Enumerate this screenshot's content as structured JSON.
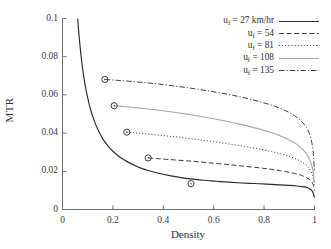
{
  "chart_data": {
    "type": "line",
    "title": "",
    "xlabel": "Density",
    "ylabel": "MTR",
    "xlim": [
      0,
      1
    ],
    "ylim": [
      0,
      0.1
    ],
    "xticks": [
      "0",
      "0.2",
      "0.4",
      "0.6",
      "0.8",
      "1"
    ],
    "xtick_values": [
      0,
      0.2,
      0.4,
      0.6,
      0.8,
      1
    ],
    "yticks": [
      "0",
      "0.02",
      "0.04",
      "0.06",
      "0.08",
      "0.1"
    ],
    "ytick_values": [
      0,
      0.02,
      0.04,
      0.06,
      0.08,
      0.1
    ],
    "grid": false,
    "legend_position": "top-right",
    "series": [
      {
        "name": "u_f = 27 km/hr",
        "label_main": "u",
        "label_sub": "f",
        "label_rest": " = 27 km/hr",
        "style": "solid",
        "color": "#2b2b2b",
        "marker_point": [
          0.51,
          0.0135
        ],
        "x": [
          0.06,
          0.065,
          0.07,
          0.075,
          0.08,
          0.09,
          0.1,
          0.11,
          0.125,
          0.14,
          0.16,
          0.18,
          0.2,
          0.23,
          0.26,
          0.3,
          0.34,
          0.38,
          0.43,
          0.47,
          0.51,
          0.56,
          0.61,
          0.66,
          0.71,
          0.76,
          0.81,
          0.86,
          0.9,
          0.93,
          0.95,
          0.965,
          0.975,
          0.985,
          0.99,
          0.995,
          1.0
        ],
        "y": [
          0.1,
          0.092,
          0.085,
          0.079,
          0.0735,
          0.065,
          0.0585,
          0.053,
          0.0468,
          0.042,
          0.037,
          0.0333,
          0.0305,
          0.0272,
          0.0248,
          0.0223,
          0.0204,
          0.019,
          0.0176,
          0.0167,
          0.016,
          0.0153,
          0.0148,
          0.0143,
          0.0139,
          0.0136,
          0.0133,
          0.0129,
          0.0126,
          0.0123,
          0.012,
          0.0117,
          0.0113,
          0.0105,
          0.0098,
          0.0085,
          0.0062
        ]
      },
      {
        "name": "u_f = 54",
        "label_main": "u",
        "label_sub": "f",
        "label_rest": " = 54",
        "style": "dashed",
        "color": "#3a3a3a",
        "marker_point": [
          0.34,
          0.027
        ],
        "x": [
          0.34,
          0.38,
          0.42,
          0.47,
          0.52,
          0.57,
          0.62,
          0.67,
          0.71,
          0.755,
          0.795,
          0.83,
          0.865,
          0.895,
          0.92,
          0.94,
          0.955,
          0.968,
          0.978,
          0.986,
          0.992,
          0.996,
          1.0
        ],
        "y": [
          0.027,
          0.0266,
          0.0262,
          0.0257,
          0.0252,
          0.0246,
          0.024,
          0.0234,
          0.0228,
          0.0222,
          0.0216,
          0.021,
          0.0203,
          0.0196,
          0.0189,
          0.0182,
          0.0175,
          0.0167,
          0.0159,
          0.0149,
          0.0138,
          0.0124,
          0.01
        ]
      },
      {
        "name": "u_f = 81",
        "label_main": "u",
        "label_sub": "f",
        "label_rest": " = 81",
        "style": "dotted",
        "color": "#4a4a4a",
        "marker_point": [
          0.255,
          0.0405
        ],
        "x": [
          0.255,
          0.3,
          0.35,
          0.4,
          0.45,
          0.5,
          0.55,
          0.6,
          0.65,
          0.7,
          0.745,
          0.79,
          0.83,
          0.865,
          0.895,
          0.92,
          0.94,
          0.955,
          0.968,
          0.978,
          0.986,
          0.992,
          0.996,
          1.0
        ],
        "y": [
          0.0405,
          0.04,
          0.0394,
          0.0387,
          0.038,
          0.0372,
          0.0364,
          0.0355,
          0.0345,
          0.0335,
          0.0325,
          0.0314,
          0.0303,
          0.0292,
          0.028,
          0.0268,
          0.0256,
          0.0244,
          0.0231,
          0.0216,
          0.0199,
          0.018,
          0.0158,
          0.012
        ]
      },
      {
        "name": "u_f = 108",
        "label_main": "u",
        "label_sub": "f",
        "label_rest": " = 108",
        "style": "solid-light",
        "color": "#a8a8a8",
        "marker_point": [
          0.205,
          0.0543
        ],
        "x": [
          0.205,
          0.25,
          0.3,
          0.35,
          0.4,
          0.45,
          0.5,
          0.55,
          0.6,
          0.65,
          0.7,
          0.745,
          0.79,
          0.83,
          0.865,
          0.895,
          0.92,
          0.94,
          0.955,
          0.968,
          0.978,
          0.986,
          0.992,
          0.996,
          1.0
        ],
        "y": [
          0.0543,
          0.0538,
          0.0532,
          0.0525,
          0.0517,
          0.0508,
          0.0498,
          0.0487,
          0.0475,
          0.0462,
          0.0448,
          0.0434,
          0.0418,
          0.0402,
          0.0385,
          0.0367,
          0.0349,
          0.033,
          0.0312,
          0.0292,
          0.027,
          0.0245,
          0.0215,
          0.0182,
          0.014
        ]
      },
      {
        "name": "u_f = 135",
        "label_main": "u",
        "label_sub": "f",
        "label_rest": " = 135",
        "style": "dashdot",
        "color": "#3f3f3f",
        "marker_point": [
          0.168,
          0.0681
        ],
        "x": [
          0.168,
          0.21,
          0.26,
          0.31,
          0.36,
          0.41,
          0.46,
          0.51,
          0.56,
          0.61,
          0.66,
          0.705,
          0.75,
          0.79,
          0.83,
          0.865,
          0.895,
          0.92,
          0.94,
          0.955,
          0.968,
          0.978,
          0.986,
          0.992,
          0.996,
          1.0
        ],
        "y": [
          0.0681,
          0.0677,
          0.0672,
          0.0666,
          0.066,
          0.0652,
          0.0644,
          0.0635,
          0.0625,
          0.0614,
          0.0602,
          0.059,
          0.0576,
          0.0562,
          0.0546,
          0.0529,
          0.0511,
          0.0492,
          0.0472,
          0.0452,
          0.043,
          0.0404,
          0.037,
          0.033,
          0.028,
          0.02
        ]
      }
    ]
  },
  "axes": {
    "x_label": "Density",
    "y_label": "MTR"
  }
}
